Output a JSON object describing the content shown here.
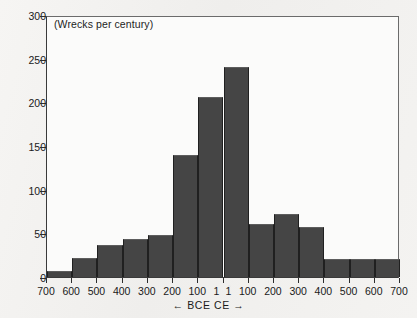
{
  "chart_data": {
    "type": "bar",
    "title": "(Wrecks per century)",
    "xlabel": "← BCE   CE →",
    "ylabel": "",
    "ylim": [
      0,
      300
    ],
    "ytick_values": [
      0,
      50,
      100,
      150,
      200,
      250,
      300
    ],
    "ytick_labels": [
      "0",
      "50",
      "100",
      "150",
      "200",
      "250",
      "300"
    ],
    "grid": false,
    "legend": null,
    "xtick_labels": [
      "700",
      "600",
      "500",
      "400",
      "300",
      "200",
      "100",
      "1",
      "1",
      "100",
      "200",
      "300",
      "400",
      "500",
      "600",
      "700"
    ],
    "categories": [
      "700–600 BCE",
      "600–500 BCE",
      "500–400 BCE",
      "400–300 BCE",
      "300–200 BCE",
      "200–100 BCE",
      "100–1 BCE",
      "1–100 CE",
      "100–200 CE",
      "200–300 CE",
      "300–400 CE",
      "400–500 CE",
      "500–600 CE",
      "600–700 CE"
    ],
    "values": [
      7,
      22,
      37,
      43,
      48,
      140,
      206,
      240,
      61,
      72,
      57,
      21,
      21,
      21
    ],
    "bar_color": "#454545"
  },
  "axis": {
    "caption": "← BCE   CE →"
  }
}
